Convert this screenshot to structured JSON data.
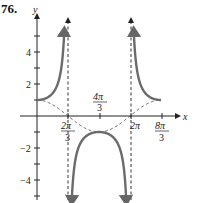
{
  "problem_label": "76.",
  "chart_data": {
    "type": "line",
    "title": "",
    "function": "y = sec(3x/4)",
    "reference_function": "y = cos(3x/4)",
    "xlabel": "x",
    "ylabel": "y",
    "x_ticks": [
      {
        "value": 2.0944,
        "label": "2π/3"
      },
      {
        "value": 4.1888,
        "label": "4π/3"
      },
      {
        "value": 6.2832,
        "label": "2π"
      },
      {
        "value": 8.3776,
        "label": "8π/3"
      }
    ],
    "y_ticks": [
      {
        "value": 4,
        "label": "4"
      },
      {
        "value": 2,
        "label": "2"
      },
      {
        "value": -2,
        "label": "-2"
      },
      {
        "value": -4,
        "label": "-4"
      }
    ],
    "asymptotes": [
      "2π/3",
      "2π"
    ],
    "key_points": [
      {
        "x": "0",
        "y": 1
      },
      {
        "x": "4π/3",
        "y": -1
      },
      {
        "x": "8π/3",
        "y": 1
      }
    ],
    "xlim": [
      0,
      8.3776
    ],
    "ylim": [
      -5.5,
      5.5
    ],
    "grid": false,
    "series": [
      {
        "name": "sec(3x/4)",
        "style": "solid",
        "color": "#6b6b6b"
      },
      {
        "name": "cos(3x/4)",
        "style": "dashed",
        "color": "#555555"
      }
    ]
  },
  "labels": {
    "x_axis": "x",
    "y_axis": "y",
    "y4": "4",
    "y2": "2",
    "yn2": "−2",
    "yn4": "−4",
    "x_2pi3_num": "2π",
    "x_2pi3_den": "3",
    "x_4pi3_num": "4π",
    "x_4pi3_den": "3",
    "x_2pi": "2π",
    "x_8pi3_num": "8π",
    "x_8pi3_den": "3"
  }
}
